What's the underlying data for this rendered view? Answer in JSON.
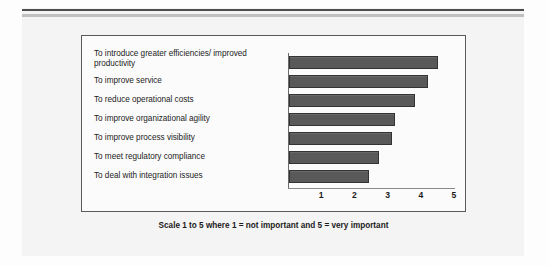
{
  "figure": {
    "caption": "Scale 1 to 5 where 1 = not important and 5 = very important",
    "frame_border_color": "#5a5a5a",
    "background_color": "#f4f4f4",
    "rule_dark_color": "#4d4d4d",
    "rule_light_color": "#c0c0c0"
  },
  "chart_data": {
    "type": "bar",
    "orientation": "horizontal",
    "title": "",
    "xlabel": "",
    "ylabel": "",
    "xlim": [
      0,
      5
    ],
    "grid": false,
    "legend": false,
    "bar_color": "#595959",
    "bar_edge_color": "#333333",
    "tick_labels": [
      "1",
      "2",
      "3",
      "4",
      "5"
    ],
    "tick_values": [
      1,
      2,
      3,
      4,
      5
    ],
    "categories": [
      "To introduce greater efficiencies/ improved productivity",
      "To improve service",
      "To reduce operational costs",
      "To improve organizational agility",
      "To improve process visibility",
      "To meet regulatory compliance",
      "To deal with integration issues"
    ],
    "values": [
      4.5,
      4.2,
      3.8,
      3.2,
      3.1,
      2.7,
      2.4
    ]
  }
}
